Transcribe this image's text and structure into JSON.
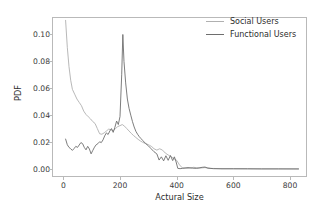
{
  "chart_data": {
    "type": "line",
    "title": "",
    "xlabel": "Actural Size",
    "ylabel": "PDF",
    "xlim": [
      -40,
      860
    ],
    "ylim": [
      -0.006,
      0.113
    ],
    "grid": false,
    "legend_position": "top-right",
    "xticks": [
      0,
      200,
      400,
      600,
      800
    ],
    "xticklabels": [
      "0",
      "200",
      "400",
      "600",
      "800"
    ],
    "yticks": [
      0.0,
      0.02,
      0.04,
      0.06,
      0.08,
      0.1
    ],
    "yticklabels": [
      "0.00",
      "0.02",
      "0.04",
      "0.06",
      "0.08",
      "0.10"
    ],
    "series": [
      {
        "name": "Social Users",
        "color": "#b0b0b0",
        "x": [
          8,
          14,
          20,
          26,
          32,
          40,
          48,
          56,
          64,
          72,
          80,
          88,
          96,
          104,
          112,
          120,
          128,
          136,
          144,
          152,
          160,
          168,
          176,
          184,
          192,
          200,
          208,
          216,
          224,
          232,
          240,
          248,
          256,
          264,
          272,
          280,
          288,
          296,
          304,
          312,
          320,
          330,
          340,
          350,
          360,
          370,
          380,
          390,
          400,
          410,
          420,
          440,
          460,
          480,
          500,
          520,
          560,
          600,
          650,
          700,
          760,
          830
        ],
        "y": [
          0.1105,
          0.0905,
          0.076,
          0.066,
          0.0592,
          0.0556,
          0.052,
          0.0495,
          0.047,
          0.043,
          0.0405,
          0.0388,
          0.0372,
          0.0352,
          0.0338,
          0.03,
          0.0262,
          0.0258,
          0.0268,
          0.0282,
          0.0296,
          0.0292,
          0.0284,
          0.03,
          0.0315,
          0.0322,
          0.033,
          0.0318,
          0.03,
          0.0282,
          0.0264,
          0.0248,
          0.0234,
          0.022,
          0.0208,
          0.0198,
          0.019,
          0.0184,
          0.0176,
          0.0166,
          0.015,
          0.014,
          0.015,
          0.014,
          0.0118,
          0.0104,
          0.009,
          0.0078,
          0.0064,
          0.003,
          0.0008,
          0.0004,
          0.0012,
          0.0006,
          0.001,
          0.0004,
          0.0002,
          0.0002,
          0.0001,
          0.0001,
          0.0001,
          0.0
        ]
      },
      {
        "name": "Functional Users",
        "color": "#6e6e6e",
        "x": [
          8,
          14,
          20,
          26,
          32,
          38,
          44,
          50,
          56,
          62,
          68,
          74,
          80,
          86,
          92,
          98,
          104,
          110,
          116,
          122,
          128,
          134,
          140,
          146,
          152,
          158,
          164,
          170,
          176,
          182,
          188,
          194,
          200,
          206,
          210,
          214,
          220,
          226,
          232,
          238,
          244,
          250,
          256,
          262,
          268,
          274,
          280,
          290,
          300,
          310,
          320,
          330,
          338,
          346,
          354,
          362,
          370,
          378,
          386,
          392,
          398,
          404,
          412,
          420,
          440,
          455,
          470,
          490,
          500,
          510,
          530,
          560,
          600,
          650,
          700,
          760,
          830
        ],
        "y": [
          0.0222,
          0.018,
          0.016,
          0.015,
          0.0138,
          0.0152,
          0.0168,
          0.016,
          0.0178,
          0.0196,
          0.0188,
          0.016,
          0.0142,
          0.0168,
          0.0148,
          0.0112,
          0.0138,
          0.0162,
          0.018,
          0.0188,
          0.0202,
          0.0196,
          0.0216,
          0.0246,
          0.0268,
          0.0256,
          0.0282,
          0.03,
          0.0272,
          0.031,
          0.0356,
          0.033,
          0.039,
          0.07,
          0.1,
          0.08,
          0.064,
          0.052,
          0.045,
          0.04,
          0.0352,
          0.0312,
          0.028,
          0.0258,
          0.024,
          0.0226,
          0.0212,
          0.019,
          0.0172,
          0.015,
          0.0128,
          0.0112,
          0.0066,
          0.009,
          0.006,
          0.0098,
          0.0064,
          0.01,
          0.0062,
          0.009,
          0.0052,
          0.0004,
          0.0002,
          0.0004,
          0.001,
          0.0006,
          0.0004,
          0.0012,
          0.0014,
          0.0006,
          0.0002,
          0.0001,
          0.0001,
          0.0001,
          0.0,
          0.0,
          0.0
        ]
      }
    ]
  }
}
